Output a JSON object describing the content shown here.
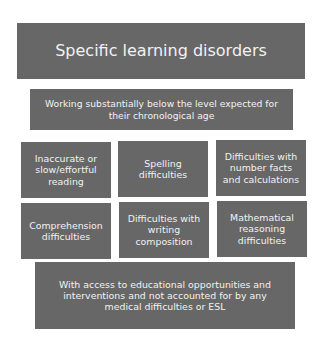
{
  "diagram": {
    "title": "Specific learning disorders",
    "criterion": "Working substantially below the level expected for\ntheir chronological age",
    "difficulties": [
      "Inaccurate or\nslow/effortful\nreading",
      "Spelling\ndifficulties",
      "Difficulties with\nnumber facts\nand calculations",
      "Comprehension\ndifficulties",
      "Difficulties with\nwriting\ncomposition",
      "Mathematical\nreasoning\ndifficulties"
    ],
    "exclusion": "With access to educational opportunities and\ninterventions and not accounted for by any\nmedical difficulties or ESL",
    "colors": {
      "box": "#676767",
      "text": "#f2f2f2",
      "background": "#ffffff"
    }
  }
}
